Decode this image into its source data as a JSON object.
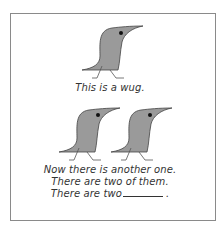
{
  "figure": {
    "caption_single": "This is a wug.",
    "caption_lines": [
      "Now there is another one.",
      "There are two of them.",
      "There are two"
    ],
    "caption_end": ".",
    "colors": {
      "bird_fill": "#9a9a9a",
      "bird_stroke": "#444444",
      "border": "#8a8a8a"
    }
  }
}
